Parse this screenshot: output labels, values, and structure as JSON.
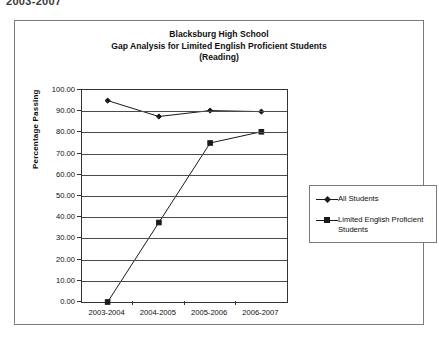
{
  "page": {
    "header_text": "2003-2007"
  },
  "chart_data": {
    "type": "line",
    "title": "Blacksburg High School\nGap Analysis for Limited English Proficient Students\n(Reading)",
    "title_lines": [
      "Blacksburg High School",
      "Gap Analysis for Limited English Proficient Students",
      "(Reading)"
    ],
    "categories": [
      "2003-2004",
      "2004-2005",
      "2005-2006",
      "2006-2007"
    ],
    "series": [
      {
        "name": "All Students",
        "marker": "diamond",
        "color": "#1a1a1a",
        "values": [
          95.0,
          87.5,
          90.3,
          89.8
        ]
      },
      {
        "name": "Limited English Proficient Students",
        "marker": "square",
        "color": "#1a1a1a",
        "values": [
          0.0,
          37.5,
          75.0,
          80.3
        ]
      }
    ],
    "xlabel": "",
    "ylabel": "Percentage Passing",
    "ylim": [
      0,
      100
    ],
    "ytick_step": 10,
    "ytick_labels": [
      "100.00",
      "90.00",
      "80.00",
      "70.00",
      "60.00",
      "50.00",
      "40.00",
      "30.00",
      "20.00",
      "10.00",
      "0.00"
    ],
    "grid": true,
    "legend_position": "right",
    "legend_entries": [
      {
        "label": "All Students",
        "marker": "diamond"
      },
      {
        "label": "Limited English Proficient Students",
        "marker": "square"
      }
    ]
  }
}
